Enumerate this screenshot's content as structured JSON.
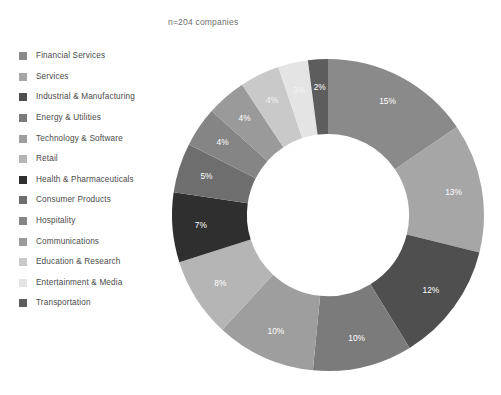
{
  "note": "n=204 companies",
  "legend": {
    "items": [
      {
        "label": "Financial Services",
        "color": "#8a8a8a"
      },
      {
        "label": "Services",
        "color": "#a6a6a6"
      },
      {
        "label": "Industrial & Manufacturing",
        "color": "#4f4f4f"
      },
      {
        "label": "Energy & Utilities",
        "color": "#7b7b7b"
      },
      {
        "label": "Technology & Software",
        "color": "#9e9e9e"
      },
      {
        "label": "Retail",
        "color": "#b5b5b5"
      },
      {
        "label": "Health & Pharmaceuticals",
        "color": "#2f2f2f"
      },
      {
        "label": "Consumer Products",
        "color": "#6e6e6e"
      },
      {
        "label": "Hospitality",
        "color": "#858585"
      },
      {
        "label": "Communications",
        "color": "#9a9a9a"
      },
      {
        "label": "Education & Research",
        "color": "#c9c9c9"
      },
      {
        "label": "Entertainment & Media",
        "color": "#e4e4e4"
      },
      {
        "label": "Transportation",
        "color": "#5d5d5d"
      }
    ]
  },
  "chart_data": {
    "type": "pie",
    "variant": "donut",
    "title": "",
    "subtitle": "n=204 companies",
    "total_n": 204,
    "units": "percent",
    "inner_radius_ratio": 0.52,
    "start_angle_deg": 0,
    "direction": "clockwise",
    "legend_position": "left",
    "grid": false,
    "categories": [
      "Financial Services",
      "Services",
      "Industrial & Manufacturing",
      "Energy & Utilities",
      "Technology & Software",
      "Retail",
      "Health & Pharmaceuticals",
      "Consumer Products",
      "Hospitality",
      "Communications",
      "Education & Research",
      "Entertainment & Media",
      "Transportation"
    ],
    "values": [
      15,
      13,
      12,
      10,
      10,
      8,
      7,
      5,
      4,
      4,
      4,
      3,
      2
    ],
    "labels": [
      "15%",
      "13%",
      "12%",
      "10%",
      "10%",
      "8%",
      "7%",
      "5%",
      "4%",
      "4%",
      "4%",
      "3%",
      "2%"
    ],
    "colors": [
      "#8a8a8a",
      "#a6a6a6",
      "#4f4f4f",
      "#7b7b7b",
      "#9e9e9e",
      "#b5b5b5",
      "#2f2f2f",
      "#6e6e6e",
      "#858585",
      "#9a9a9a",
      "#c9c9c9",
      "#e4e4e4",
      "#5d5d5d"
    ],
    "label_tone": [
      "dark",
      "dark",
      "dark",
      "dark",
      "dark",
      "dark",
      "dark",
      "dark",
      "dark",
      "dark",
      "light",
      "light",
      "dark"
    ]
  }
}
